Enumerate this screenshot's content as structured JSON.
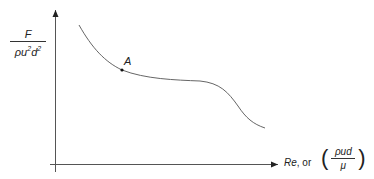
{
  "diagram": {
    "type": "curve-sketch",
    "y_axis_label": {
      "numerator": "F",
      "denominator_base": "ρu",
      "denominator_exp1": "2",
      "denominator_d": "d",
      "denominator_exp2": "2"
    },
    "x_axis_label": {
      "re": "Re",
      "or": ", or",
      "paren_open": "(",
      "numerator": "ρud",
      "denominator": "μ",
      "paren_close": ")"
    },
    "point_label": "A",
    "colors": {
      "axis": "#333333",
      "curve": "#666666",
      "text": "#222222"
    }
  }
}
